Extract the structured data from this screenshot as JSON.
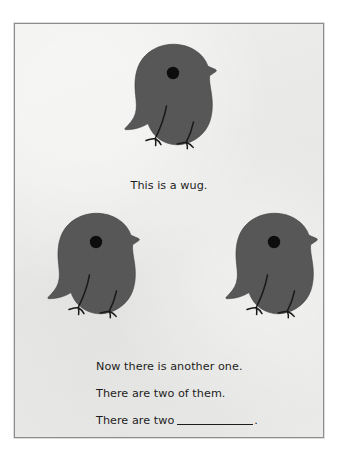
{
  "page": {
    "background_color": "#e9e9e7",
    "border_color": "#8d8d8d",
    "outer_background": "#ffffff"
  },
  "figure": {
    "creature_name": "wug",
    "body_color": "#575757",
    "eye_color": "#0d0d0d",
    "outline_color": "#1a1a1a",
    "count_top": 1,
    "count_bottom": 2,
    "total": 2
  },
  "captions": {
    "line1": "This is a wug.",
    "line2": "Now there is another one.",
    "line3": "There are two of them.",
    "line4_prefix": "There are two",
    "line4_blank": "",
    "line4_suffix": "."
  },
  "wugs": [
    {
      "id": "wug-top",
      "label": "wug-top",
      "x": 123,
      "y": 19,
      "w": 98,
      "h": 120
    },
    {
      "id": "wug-bottom-left",
      "label": "wug-bottom-left",
      "x": 32,
      "y": 188,
      "w": 98,
      "h": 120
    },
    {
      "id": "wug-bottom-right",
      "label": "wug-bottom-right",
      "x": 210,
      "y": 188,
      "w": 98,
      "h": 120
    }
  ]
}
